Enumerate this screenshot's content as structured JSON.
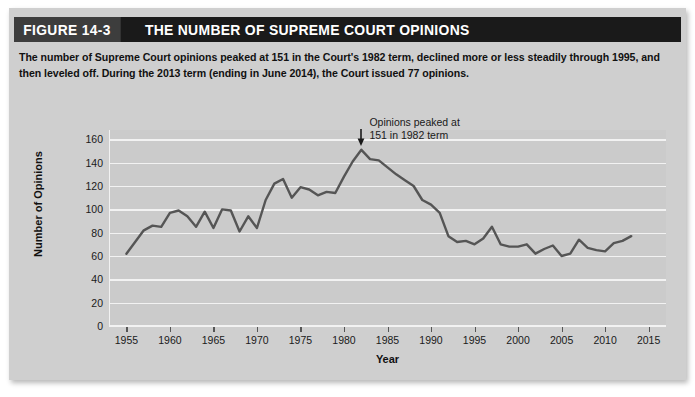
{
  "figure": {
    "number_label": "FIGURE 14-3",
    "title": "THE NUMBER OF SUPREME COURT OPINIONS",
    "caption": "The number of Supreme Court opinions peaked at 151 in the Court's 1982 term, declined more or less steadily through 1995, and then leveled off. During the 2013 term (ending in June 2014), the Court issued 77 opinions."
  },
  "colors": {
    "header_bar": "#1a1a1a",
    "figure_number_block": "#3d3d3d",
    "panel_background": "#cfcfcf",
    "plot_background": "#cbcbcb",
    "gridline": "#f2f2f2",
    "line_series": "#555555"
  },
  "chart_data": {
    "type": "line",
    "title": "THE NUMBER OF SUPREME COURT OPINIONS",
    "xlabel": "Year",
    "ylabel": "Number of Opinions",
    "xlim": [
      1953,
      2017
    ],
    "ylim": [
      0,
      168
    ],
    "yticks": [
      0,
      20,
      40,
      60,
      80,
      100,
      120,
      140,
      160
    ],
    "xticks": [
      1955,
      1960,
      1965,
      1970,
      1975,
      1980,
      1985,
      1990,
      1995,
      2000,
      2005,
      2010,
      2015
    ],
    "grid": "horizontal",
    "legend": "none",
    "annotations": [
      {
        "text_line1": "Opinions peaked at",
        "text_line2": "151 in 1982 term",
        "marker": "down-arrow",
        "points_to_year": 1982,
        "points_to_value": 151
      }
    ],
    "series": [
      {
        "name": "Number of Supreme Court opinions",
        "x": [
          1955,
          1956,
          1957,
          1958,
          1959,
          1960,
          1961,
          1962,
          1963,
          1964,
          1965,
          1966,
          1967,
          1968,
          1969,
          1970,
          1971,
          1972,
          1973,
          1974,
          1975,
          1976,
          1977,
          1978,
          1979,
          1980,
          1981,
          1982,
          1983,
          1984,
          1985,
          1986,
          1987,
          1988,
          1989,
          1990,
          1991,
          1992,
          1993,
          1994,
          1995,
          1996,
          1997,
          1998,
          1999,
          2000,
          2001,
          2002,
          2003,
          2004,
          2005,
          2006,
          2007,
          2008,
          2009,
          2010,
          2011,
          2012,
          2013
        ],
        "y": [
          62,
          72,
          82,
          86,
          85,
          97,
          99,
          94,
          85,
          98,
          84,
          100,
          99,
          81,
          94,
          84,
          108,
          122,
          126,
          110,
          119,
          117,
          112,
          115,
          114,
          128,
          141,
          151,
          143,
          142,
          136,
          130,
          125,
          120,
          108,
          104,
          97,
          77,
          72,
          73,
          70,
          75,
          85,
          70,
          68,
          68,
          70,
          62,
          66,
          69,
          60,
          62,
          74,
          67,
          65,
          64,
          71,
          73,
          77
        ]
      }
    ]
  }
}
